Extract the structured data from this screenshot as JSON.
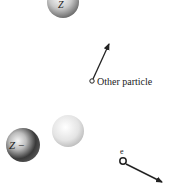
{
  "diagram": {
    "nucleus_top": {
      "label": "Z"
    },
    "other_particle": {
      "label": "Other particle"
    },
    "ion": {
      "label": "Z −"
    },
    "neutral_atom": {
      "label": ""
    },
    "electron": {
      "label": "e"
    }
  },
  "colors": {
    "background": "#ffffff",
    "ink": "#222222",
    "dark_sphere": "#3a3a3a",
    "light_sphere": "#d9d9d9"
  }
}
